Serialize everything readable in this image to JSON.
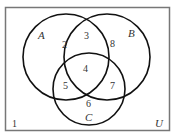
{
  "diagram": {
    "type": "venn",
    "universe": {
      "label": "U"
    },
    "sets": [
      {
        "label": "A"
      },
      {
        "label": "B"
      },
      {
        "label": "C"
      }
    ],
    "regions": {
      "A_only": "2",
      "A_and_B_only": "3",
      "B_only": "8",
      "A_and_B_and_C": "4",
      "A_and_C_only": "5",
      "B_and_C_only": "7",
      "C_only": "6",
      "outside": "1"
    },
    "colors": {
      "stroke": "#111111",
      "border": "#777777",
      "text": "#333333"
    }
  }
}
